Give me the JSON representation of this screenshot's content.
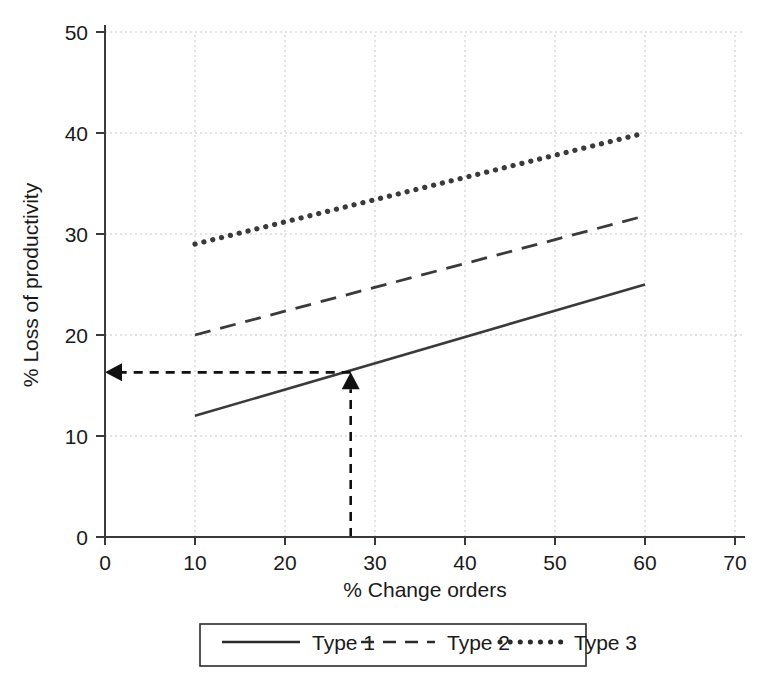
{
  "chart_data": {
    "type": "line",
    "title": "",
    "xlabel": "% Change orders",
    "ylabel": "% Loss of productivity",
    "xlim": [
      0,
      70
    ],
    "ylim": [
      0,
      50
    ],
    "xticks": [
      0,
      10,
      20,
      30,
      40,
      50,
      60,
      70
    ],
    "yticks": [
      0,
      10,
      20,
      30,
      40,
      50
    ],
    "grid": true,
    "legend_position": "bottom",
    "series": [
      {
        "name": "Type 1",
        "style": "solid",
        "x": [
          10,
          60
        ],
        "y": [
          12,
          25
        ]
      },
      {
        "name": "Type 2",
        "style": "dashed",
        "x": [
          10,
          60
        ],
        "y": [
          20,
          31.8
        ]
      },
      {
        "name": "Type 3",
        "style": "dotted",
        "x": [
          10,
          60
        ],
        "y": [
          29,
          40
        ]
      }
    ],
    "annotations": [
      {
        "name": "vertical-reference-arrow",
        "kind": "arrow",
        "direction": "up",
        "from": [
          27.3,
          0
        ],
        "to": [
          27.3,
          16.3
        ]
      },
      {
        "name": "horizontal-reference-arrow",
        "kind": "arrow",
        "direction": "left",
        "from": [
          27.3,
          16.3
        ],
        "to": [
          0,
          16.3
        ]
      }
    ]
  },
  "axes": {
    "x_title": "% Change orders",
    "y_title": "% Loss of productivity",
    "x_tick_labels": [
      "0",
      "10",
      "20",
      "30",
      "40",
      "50",
      "60",
      "70"
    ],
    "y_tick_labels": [
      "0",
      "10",
      "20",
      "30",
      "40",
      "50"
    ]
  },
  "legend": {
    "entries": [
      {
        "label": "Type 1",
        "style": "solid"
      },
      {
        "label": "Type 2",
        "style": "dashed"
      },
      {
        "label": "Type 3",
        "style": "dotted"
      }
    ]
  },
  "colors": {
    "line": "#3a3a3a",
    "grid": "#c9c9c9",
    "axis": "#3a3a3a",
    "annotation": "#111111",
    "text": "#1a1a1a",
    "background": "#ffffff"
  }
}
